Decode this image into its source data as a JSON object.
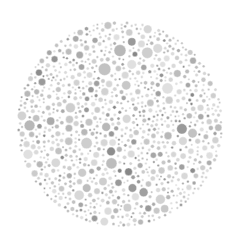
{
  "image": {
    "kind": "ishihara-color-vision-test-plate",
    "title": "Ishihara Color Vision Test Plate (grayscale)",
    "width": 240,
    "height": 249,
    "background_color": "#ffffff",
    "hidden_numeral_visible": false,
    "hidden_numeral_text": ""
  },
  "plate": {
    "center_x": 120,
    "center_y": 124,
    "radius": 103,
    "dot_gap": 0.85,
    "min_radius": 1.1,
    "max_radius": 6.6,
    "target_count": 1150,
    "placement_attempts": 42000,
    "seed": 20240917
  },
  "palette": {
    "light_tones": [
      "#e0e0e0",
      "#dadada",
      "#d6d6d6",
      "#d2d2d2",
      "#cecece",
      "#d8d8d8",
      "#dcdcdc"
    ],
    "light_weight": 0.46,
    "mid_tones": [
      "#c8c8c8",
      "#c2c2c2",
      "#bdbdbd",
      "#b8b8b8",
      "#c5c5c5",
      "#cbcbcb"
    ],
    "mid_weight": 0.33,
    "dark_tones": [
      "#aeaeae",
      "#a6a6a6",
      "#a0a0a0",
      "#9a9a9a",
      "#ababab"
    ],
    "dark_weight": 0.16,
    "accent_tones": [
      "#949494",
      "#8d8d8d",
      "#878787",
      "#909090"
    ],
    "accent_weight": 0.05,
    "stroke_color": "#ffffff",
    "stroke_width": 0.45
  },
  "size_mix": {
    "tiny_weight": 0.3,
    "small_weight": 0.28,
    "medium_weight": 0.26,
    "large_weight": 0.16,
    "tiny_range": [
      1.1,
      1.9
    ],
    "small_range": [
      1.9,
      3.0
    ],
    "medium_range": [
      3.0,
      4.5
    ],
    "large_range": [
      4.5,
      6.6
    ]
  }
}
